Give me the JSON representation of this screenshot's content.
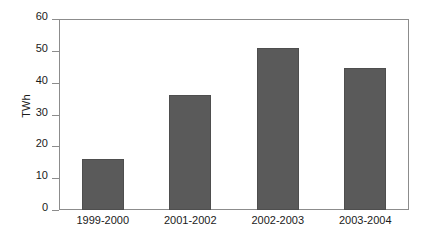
{
  "chart_data": {
    "type": "bar",
    "title": "",
    "subtitle": "",
    "xlabel": "",
    "ylabel": "TWh",
    "categories": [
      "1999-2000",
      "2001-2002",
      "2002-2003",
      "2003-2004"
    ],
    "values": [
      16,
      36,
      51,
      44.5
    ],
    "series": [
      {
        "name": "TWh",
        "values": [
          16,
          36,
          51,
          44.5
        ]
      }
    ],
    "ylim": [
      0,
      60
    ],
    "y_ticks": [
      0,
      10,
      20,
      30,
      40,
      50,
      60
    ],
    "y_tick_labels": [
      "0",
      "10",
      "20",
      "30",
      "40",
      "50",
      "60"
    ],
    "grid": false,
    "legend": false,
    "legend_position": "none",
    "annotations": [],
    "colors": {
      "bar_fill": "#5a5a5a",
      "bar_edge": "#4e4e4e",
      "axis": "#8c8c8c",
      "text": "#1a1a1a",
      "background": "#ffffff"
    }
  }
}
